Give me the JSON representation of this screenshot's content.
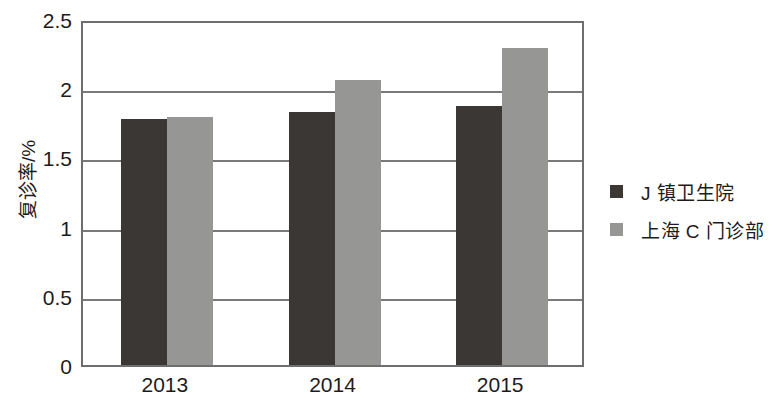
{
  "chart_data": {
    "type": "bar",
    "title": "",
    "subtitle": "",
    "xlabel": "",
    "ylabel": "复诊率/%",
    "categories": [
      "2013",
      "2014",
      "2015"
    ],
    "series": [
      {
        "name": "J 镇卫生院",
        "color": "#3b3735",
        "values": [
          1.78,
          1.83,
          1.87
        ]
      },
      {
        "name": "上海 C 门诊部",
        "color": "#969694",
        "values": [
          1.79,
          2.06,
          2.29
        ]
      }
    ],
    "ylim": [
      0,
      2.5
    ],
    "ytick_labels": [
      "0",
      "0.5",
      "1",
      "1.5",
      "2",
      "2.5"
    ],
    "ytick_values": [
      0,
      0.5,
      1,
      1.5,
      2,
      2.5
    ],
    "grid": true,
    "grid_axis": "y",
    "legend_position": "right",
    "annotations": []
  },
  "legend": {
    "items": [
      {
        "label": "J 镇卫生院",
        "swatch": "dark"
      },
      {
        "label": "上海 C 门诊部",
        "swatch": "light"
      }
    ]
  }
}
